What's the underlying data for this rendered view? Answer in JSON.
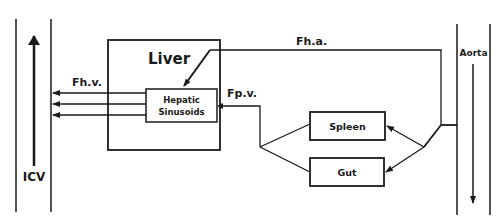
{
  "diagram": {
    "colors": {
      "line": "#1a1a1a",
      "background": "#ffffff"
    },
    "vessels": {
      "icv": {
        "label": "ICV",
        "flow": "upward"
      },
      "aorta": {
        "label": "Aorta",
        "flow": "downward"
      }
    },
    "organs": {
      "liver": {
        "label": "Liver"
      },
      "sinusoids": {
        "label_line1": "Hepatic",
        "label_line2": "Sinusoids"
      },
      "spleen": {
        "label": "Spleen"
      },
      "gut": {
        "label": "Gut"
      }
    },
    "flows": {
      "hepatic_vein": {
        "label": "Fh.v."
      },
      "hepatic_artery": {
        "label": "Fh.a."
      },
      "portal_vein": {
        "label": "Fp.v."
      }
    }
  }
}
